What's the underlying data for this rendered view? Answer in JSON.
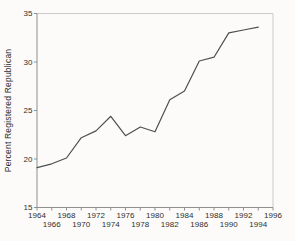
{
  "figure": {
    "background": "#fcfbf9"
  },
  "chart_data": {
    "type": "line",
    "title": "",
    "xlabel": "",
    "ylabel": "Percent Registered Republican",
    "x": [
      1964,
      1966,
      1968,
      1970,
      1972,
      1974,
      1976,
      1978,
      1980,
      1982,
      1984,
      1986,
      1988,
      1990,
      1992,
      1994
    ],
    "values": [
      19.1,
      19.5,
      20.1,
      22.2,
      22.9,
      24.4,
      22.4,
      23.3,
      22.8,
      26.1,
      27.0,
      30.1,
      30.5,
      33.0,
      33.3,
      33.6
    ],
    "series_name": "Percent Registered Republican",
    "xlim": [
      1964,
      1996
    ],
    "ylim": [
      15,
      35
    ],
    "xticks": [
      1964,
      1966,
      1968,
      1970,
      1972,
      1974,
      1976,
      1978,
      1980,
      1982,
      1984,
      1986,
      1988,
      1990,
      1992,
      1994,
      1996
    ],
    "yticks": [
      15,
      20,
      25,
      30,
      35
    ],
    "x_tick_labels_staggered": true,
    "grid": false,
    "legend": false,
    "line_color": "#4f4f4f",
    "axis_color": "#8f8f8f",
    "frame_color": "#cbcbc9",
    "text_color": "#2f2f2f"
  }
}
